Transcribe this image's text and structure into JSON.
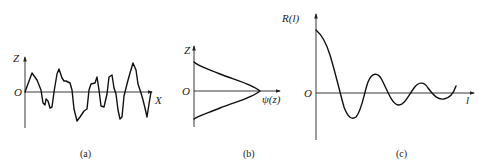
{
  "figure": {
    "panels": [
      {
        "id": "a",
        "caption": "(a)",
        "y_axis_label": "Z",
        "x_axis_label": "X",
        "origin_label": "O",
        "description": "random surface profile z(x)"
      },
      {
        "id": "b",
        "caption": "(b)",
        "y_axis_label": "Z",
        "x_axis_label": "ψ(z)",
        "origin_label": "O",
        "description": "Gaussian height distribution"
      },
      {
        "id": "c",
        "caption": "(c)",
        "y_axis_label": "R(l)",
        "x_axis_label": "l",
        "origin_label": "O",
        "description": "autocorrelation function, damped oscillation"
      }
    ]
  },
  "colors": {
    "background": "#ffffff",
    "line": "#111111"
  }
}
